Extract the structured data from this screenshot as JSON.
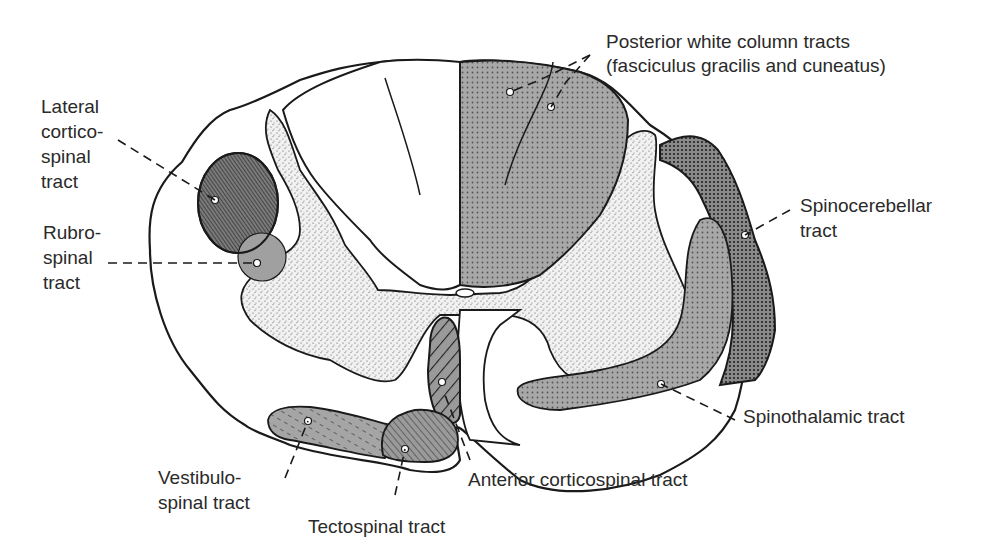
{
  "colors": {
    "outline": "#1a1a1a",
    "text": "#2a2a2a",
    "tract_fill": "#9a9a9a",
    "dark_tract_fill": "#6a6a6a",
    "grey_matter": "#e8e8e8"
  },
  "labels": {
    "posterior_white_column": "Posterior white column tracts\n(fasciculus gracilis and cuneatus)",
    "lateral_corticospinal": "Lateral\ncortico-\nspinal\ntract",
    "rubrospinal": "Rubro-\nspinal\ntract",
    "spinocerebellar": "Spinocerebellar\ntract",
    "spinothalamic": "Spinothalamic tract",
    "vestibulospinal": "Vestibulo-\nspinal tract",
    "tectospinal": "Tectospinal tract",
    "anterior_corticospinal": "Anterior corticospinal tract"
  }
}
